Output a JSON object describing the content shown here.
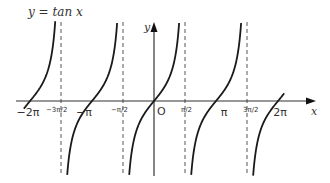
{
  "title": "y = tan x",
  "function": "tan",
  "axes": {
    "x_label": "x",
    "y_label": "y",
    "origin_label": "O",
    "x_range_pi": [
      -2.1,
      2.5
    ],
    "y_range": [
      -2.3,
      2.4
    ]
  },
  "x_ticks": [
    {
      "value_pi": -2,
      "label": "−2π"
    },
    {
      "value_pi": -1.5,
      "label": "−3π/2"
    },
    {
      "value_pi": -1,
      "label": "−π"
    },
    {
      "value_pi": -0.5,
      "label": "−π/2"
    },
    {
      "value_pi": 0.5,
      "label": "π/2"
    },
    {
      "value_pi": 1,
      "label": "π"
    },
    {
      "value_pi": 1.5,
      "label": "3π/2"
    },
    {
      "value_pi": 2,
      "label": "2π"
    }
  ],
  "asymptotes_pi": [
    -1.5,
    -0.5,
    0.5,
    1.5
  ],
  "branches_pi": [
    [
      -2.1,
      -1.5
    ],
    [
      -1.5,
      -0.5
    ],
    [
      -0.5,
      0.5
    ],
    [
      0.5,
      1.5
    ],
    [
      1.5,
      2.1
    ]
  ],
  "colors": {
    "curve": "#1a1a1a",
    "axis": "#333333",
    "asymptote": "#555555"
  }
}
